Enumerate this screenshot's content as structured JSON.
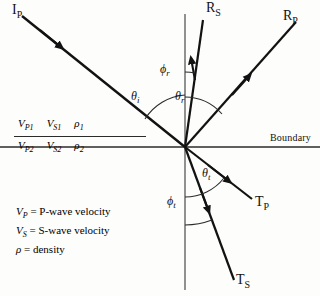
{
  "figure": {
    "background_color": "#fdfdfb",
    "line_color": "#121212"
  },
  "boundary": {
    "label": "Boundary"
  },
  "rays": [
    {
      "id": "incident-p",
      "base": "I",
      "sub": "P",
      "label": "I_P"
    },
    {
      "id": "reflected-s",
      "base": "R",
      "sub": "S",
      "label": "R_S"
    },
    {
      "id": "reflected-p",
      "base": "R",
      "sub": "P",
      "label": "R_P"
    },
    {
      "id": "transmitted-p",
      "base": "T",
      "sub": "P",
      "label": "T_P"
    },
    {
      "id": "transmitted-s",
      "base": "T",
      "sub": "S",
      "label": "T_S"
    }
  ],
  "angles": [
    {
      "id": "incidence",
      "base": "θ",
      "sub": "i"
    },
    {
      "id": "reflection-p",
      "base": "θ",
      "sub": "r"
    },
    {
      "id": "reflection-s",
      "base": "ϕ",
      "sub": "r"
    },
    {
      "id": "transmission-p",
      "base": "θ",
      "sub": "t"
    },
    {
      "id": "transmission-s",
      "base": "ϕ",
      "sub": "t"
    }
  ],
  "media": {
    "upper": [
      {
        "base": "V",
        "sub": "P1"
      },
      {
        "base": "V",
        "sub": "S1"
      },
      {
        "base": "ρ",
        "sub": "1"
      }
    ],
    "lower": [
      {
        "base": "V",
        "sub": "P2"
      },
      {
        "base": "V",
        "sub": "S2"
      },
      {
        "base": "ρ",
        "sub": "2"
      }
    ]
  },
  "legend": [
    {
      "base": "V",
      "sub": "P",
      "text": " = P-wave velocity"
    },
    {
      "base": "V",
      "sub": "S",
      "text": " = S-wave velocity"
    },
    {
      "base": "ρ",
      "sub": "",
      "text": " = density"
    }
  ]
}
